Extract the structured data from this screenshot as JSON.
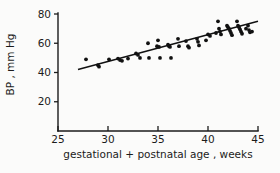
{
  "chart_data": {
    "type": "scatter",
    "title": "",
    "subtitle": "",
    "xlabel": "gestational + postnatal age , weeks",
    "ylabel": "BP , mm Hg",
    "xlim": [
      25,
      45
    ],
    "ylim": [
      0,
      80
    ],
    "xticks": [
      25,
      30,
      35,
      40,
      45
    ],
    "yticks": [
      20,
      40,
      60,
      80
    ],
    "xtick_labels": [
      "25",
      "30",
      "35",
      "40",
      "45"
    ],
    "ytick_labels": [
      "20",
      "40",
      "60",
      "80"
    ],
    "grid": false,
    "legend": false,
    "legend_position": "none",
    "marker": "filled-circle",
    "marker_color": "#111111",
    "line_color": "#111111",
    "axis_color": "#1b1b1b",
    "background_color": "#fbfbfa",
    "series": [
      {
        "name": "blood pressure measurements",
        "type": "scatter",
        "x": [
          27.8,
          29.0,
          29.1,
          30.1,
          31.0,
          31.2,
          31.4,
          32.0,
          32.8,
          33.0,
          33.2,
          34.0,
          34.1,
          34.9,
          35.0,
          35.1,
          35.2,
          36.0,
          36.1,
          36.2,
          36.3,
          37.0,
          37.1,
          37.8,
          38.0,
          38.1,
          38.9,
          39.0,
          39.1,
          39.8,
          40.0,
          40.2,
          40.8,
          41.0,
          41.1,
          41.2,
          41.3,
          41.9,
          42.0,
          42.1,
          42.2,
          42.3,
          42.4,
          42.9,
          43.0,
          43.1,
          43.2,
          43.3,
          43.4,
          43.8,
          44.0,
          44.1,
          44.2,
          44.4
        ],
        "y": [
          49.0,
          45.0,
          44.0,
          49.0,
          49.5,
          48.5,
          48.0,
          49.5,
          53.0,
          52.0,
          50.0,
          60.0,
          50.0,
          58.0,
          62.0,
          57.5,
          50.0,
          59.0,
          58.0,
          57.5,
          50.0,
          63.0,
          58.0,
          61.5,
          58.0,
          57.0,
          63.0,
          61.0,
          58.5,
          62.0,
          66.0,
          65.0,
          67.0,
          75.0,
          70.0,
          68.0,
          66.0,
          72.0,
          71.0,
          70.0,
          68.5,
          67.0,
          65.5,
          75.0,
          72.0,
          71.0,
          69.5,
          68.0,
          66.5,
          70.0,
          72.0,
          69.0,
          67.5,
          68.0
        ]
      },
      {
        "name": "regression line",
        "type": "line",
        "x": [
          27.0,
          45.0
        ],
        "y": [
          42.0,
          75.0
        ]
      }
    ]
  },
  "axes": {
    "x_axis_name": "x-axis",
    "y_axis_name": "y-axis"
  }
}
